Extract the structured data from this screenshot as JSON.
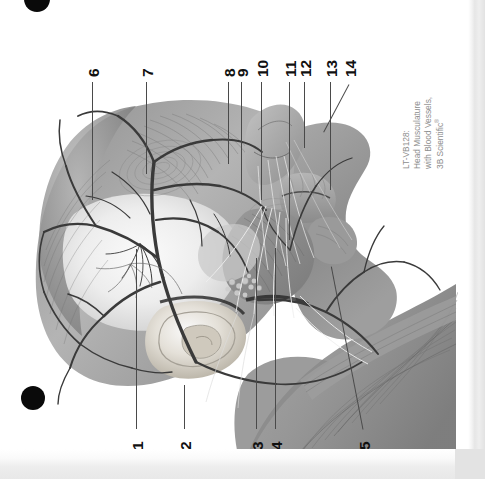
{
  "document": {
    "kind": "scanned-anatomy-plate",
    "orientation": "rotated-90-ccw",
    "background_color": "#ffffff"
  },
  "caption": {
    "line1": "LT-VB128:",
    "line2": "Head Musculature",
    "line3": "with Blood Vessels,",
    "line4": "3B Scientific",
    "trademark": "®",
    "color": "#8d8d8d"
  },
  "registration_marks": [
    {
      "name": "top-dot",
      "color": "#0a0a0a"
    },
    {
      "name": "bottom-dot",
      "color": "#0a0a0a"
    }
  ],
  "figure": {
    "title": "Head Musculature with Blood Vessels",
    "view": "lateral view of head, superficial muscles and vasculature",
    "leader_line_color": "#4a4a4a"
  },
  "labels": {
    "bottom_row": [
      {
        "id": "1",
        "text": "1"
      },
      {
        "id": "2",
        "text": "2"
      },
      {
        "id": "3",
        "text": "3"
      },
      {
        "id": "4",
        "text": "4"
      },
      {
        "id": "5",
        "text": "5"
      }
    ],
    "top_row": [
      {
        "id": "6",
        "text": "6"
      },
      {
        "id": "7",
        "text": "7"
      },
      {
        "id": "8",
        "text": "8"
      },
      {
        "id": "9",
        "text": "9"
      },
      {
        "id": "10",
        "text": "10"
      },
      {
        "id": "11",
        "text": "11"
      },
      {
        "id": "12",
        "text": "12"
      },
      {
        "id": "13",
        "text": "13"
      },
      {
        "id": "14",
        "text": "14"
      }
    ]
  }
}
